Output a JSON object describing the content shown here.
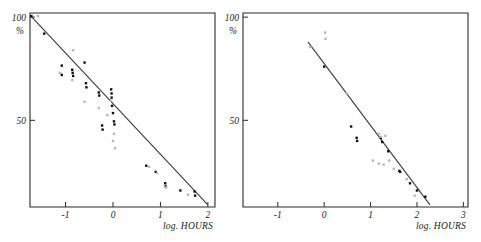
{
  "figure": {
    "background_color": "#ffffff",
    "ink_color": "#1a1a1a",
    "panel_count": 2
  },
  "chart_data": [
    {
      "type": "scatter",
      "panel_id": "left-panel",
      "title": "",
      "xlabel": "log. HOURS",
      "ylabel": "%",
      "xlim": [
        -1.75,
        2.15
      ],
      "ylim": [
        8,
        102
      ],
      "xticks": [
        -1,
        0,
        1,
        2
      ],
      "xtick_labels": [
        "-1",
        "0",
        "1",
        "2"
      ],
      "yticks": [
        100,
        50
      ],
      "ytick_labels": [
        "100",
        "50"
      ],
      "grid": false,
      "legend": "none",
      "trendline": {
        "x": [
          -1.75,
          2.0
        ],
        "y": [
          101,
          9
        ]
      },
      "series": [
        {
          "name": "filled-markers",
          "marker": "filled-square",
          "color": "#111111",
          "points": [
            [
              -1.72,
              100.5
            ],
            [
              -1.45,
              92.0
            ],
            [
              -1.08,
              76.5
            ],
            [
              -1.08,
              72.0
            ],
            [
              -0.86,
              74.5
            ],
            [
              -0.85,
              73.0
            ],
            [
              -0.84,
              71.5
            ],
            [
              -0.6,
              78.0
            ],
            [
              -0.57,
              68.0
            ],
            [
              -0.56,
              66.0
            ],
            [
              -0.3,
              63.5
            ],
            [
              -0.29,
              62.0
            ],
            [
              -0.04,
              65.0
            ],
            [
              -0.03,
              63.0
            ],
            [
              -0.03,
              61.0
            ],
            [
              -0.02,
              57.0
            ],
            [
              -0.23,
              47.5
            ],
            [
              -0.22,
              45.5
            ],
            [
              0.0,
              53.5
            ],
            [
              0.02,
              49.5
            ],
            [
              0.03,
              48.0
            ],
            [
              0.7,
              28.0
            ],
            [
              0.9,
              25.0
            ],
            [
              1.1,
              19.5
            ],
            [
              1.11,
              18.0
            ],
            [
              1.42,
              16.0
            ],
            [
              1.72,
              15.5
            ],
            [
              1.73,
              13.5
            ]
          ]
        },
        {
          "name": "open-markers",
          "marker": "open-square",
          "color": "#b6b6b6",
          "points": [
            [
              -1.58,
              100.5
            ],
            [
              -1.12,
              73.0
            ],
            [
              -0.84,
              84.0
            ],
            [
              -0.86,
              69.5
            ],
            [
              -0.6,
              59.0
            ],
            [
              -0.3,
              56.0
            ],
            [
              -0.12,
              52.5
            ],
            [
              -0.04,
              59.5
            ],
            [
              0.02,
              43.5
            ],
            [
              0.0,
              40.0
            ],
            [
              0.04,
              36.5
            ],
            [
              0.76,
              27.5
            ],
            [
              0.93,
              24.5
            ],
            [
              1.12,
              17.5
            ],
            [
              1.58,
              14.0
            ]
          ]
        }
      ]
    },
    {
      "type": "scatter",
      "panel_id": "right-panel",
      "title": "",
      "xlabel": "log. HOURS",
      "ylabel": "%",
      "xlim": [
        -1.75,
        3.1
      ],
      "ylim": [
        8,
        102
      ],
      "xticks": [
        -1,
        0,
        1,
        2,
        3
      ],
      "xtick_labels": [
        "-1",
        "0",
        "1",
        "2",
        "3"
      ],
      "yticks": [
        100,
        50
      ],
      "ytick_labels": [
        "100",
        "50"
      ],
      "grid": false,
      "legend": "none",
      "trendline": {
        "x": [
          -0.35,
          2.28
        ],
        "y": [
          88,
          9
        ]
      },
      "series": [
        {
          "name": "filled-markers",
          "marker": "filled-square",
          "color": "#111111",
          "points": [
            [
              0.0,
              76.0
            ],
            [
              0.58,
              47.0
            ],
            [
              0.7,
              41.5
            ],
            [
              0.71,
              40.0
            ],
            [
              1.22,
              41.5
            ],
            [
              1.25,
              39.5
            ],
            [
              1.38,
              35.0
            ],
            [
              1.62,
              25.5
            ],
            [
              1.64,
              25.0
            ],
            [
              1.85,
              19.5
            ],
            [
              2.0,
              16.0
            ],
            [
              2.18,
              13.0
            ]
          ]
        },
        {
          "name": "open-markers",
          "marker": "open-square",
          "color": "#b6b6b6",
          "points": [
            [
              -0.3,
              85.5
            ],
            [
              0.02,
              92.5
            ],
            [
              0.03,
              89.5
            ],
            [
              0.48,
              63.0
            ],
            [
              1.18,
              43.5
            ],
            [
              1.22,
              42.0
            ],
            [
              1.32,
              42.5
            ],
            [
              1.05,
              30.5
            ],
            [
              1.18,
              29.0
            ],
            [
              1.4,
              30.5
            ],
            [
              1.28,
              28.5
            ],
            [
              1.5,
              26.5
            ],
            [
              1.78,
              21.5
            ],
            [
              1.95,
              13.5
            ]
          ]
        }
      ]
    }
  ]
}
